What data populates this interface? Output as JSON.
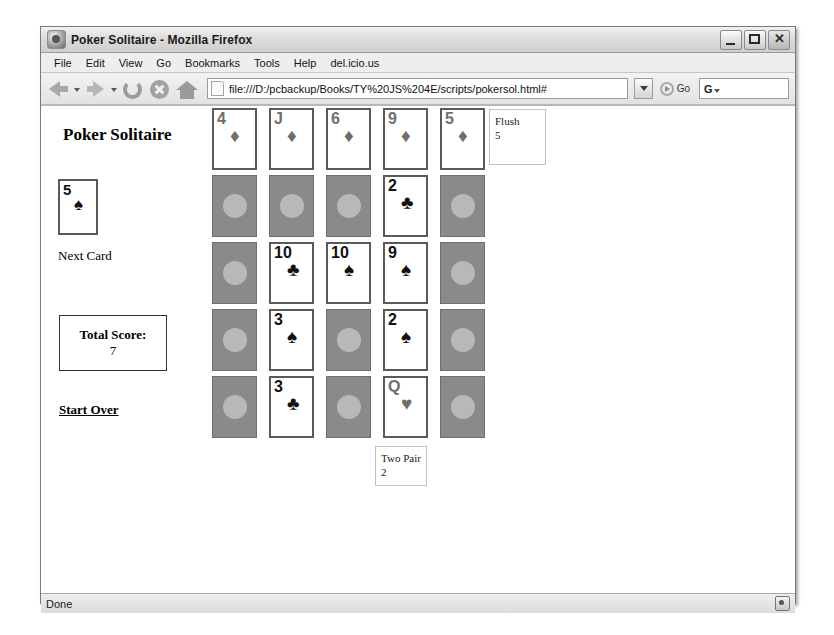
{
  "window": {
    "title": "Poker Solitaire - Mozilla Firefox",
    "app_icon": "firefox-icon",
    "minimize_label": "",
    "maximize_label": "",
    "close_label": "✕"
  },
  "menubar": {
    "items": [
      {
        "label": "File"
      },
      {
        "label": "Edit"
      },
      {
        "label": "View"
      },
      {
        "label": "Go"
      },
      {
        "label": "Bookmarks"
      },
      {
        "label": "Tools"
      },
      {
        "label": "Help"
      },
      {
        "label": "del.icio.us"
      }
    ]
  },
  "toolbar": {
    "back_icon": "back-arrow-icon",
    "forward_icon": "forward-arrow-icon",
    "reload_icon": "reload-icon",
    "stop_icon": "stop-icon",
    "home_icon": "home-icon",
    "url": "file:///D:/pcbackup/Books/TY%20JS%204E/scripts/pokersol.html#",
    "url_placeholder": "Enter address",
    "go_label": "Go",
    "search_value": "G",
    "search_placeholder": "Search"
  },
  "page": {
    "title": "Poker Solitaire",
    "next_card": {
      "rank": "5",
      "suit": "♠",
      "color": "black",
      "face_up": true
    },
    "next_card_label": "Next Card",
    "score_label": "Total Score:",
    "score_value": "7",
    "start_over_label": "Start Over",
    "grid": [
      [
        {
          "face_up": true,
          "rank": "4",
          "suit": "♦",
          "color": "red"
        },
        {
          "face_up": true,
          "rank": "J",
          "suit": "♦",
          "color": "red"
        },
        {
          "face_up": true,
          "rank": "6",
          "suit": "♦",
          "color": "red"
        },
        {
          "face_up": true,
          "rank": "9",
          "suit": "♦",
          "color": "red"
        },
        {
          "face_up": true,
          "rank": "5",
          "suit": "♦",
          "color": "red"
        }
      ],
      [
        {
          "face_up": false,
          "rank": "",
          "suit": "",
          "color": ""
        },
        {
          "face_up": false,
          "rank": "",
          "suit": "",
          "color": ""
        },
        {
          "face_up": false,
          "rank": "",
          "suit": "",
          "color": ""
        },
        {
          "face_up": true,
          "rank": "2",
          "suit": "♣",
          "color": "black"
        },
        {
          "face_up": false,
          "rank": "",
          "suit": "",
          "color": ""
        }
      ],
      [
        {
          "face_up": false,
          "rank": "",
          "suit": "",
          "color": ""
        },
        {
          "face_up": true,
          "rank": "10",
          "suit": "♣",
          "color": "black"
        },
        {
          "face_up": true,
          "rank": "10",
          "suit": "♠",
          "color": "black"
        },
        {
          "face_up": true,
          "rank": "9",
          "suit": "♠",
          "color": "black"
        },
        {
          "face_up": false,
          "rank": "",
          "suit": "",
          "color": ""
        }
      ],
      [
        {
          "face_up": false,
          "rank": "",
          "suit": "",
          "color": ""
        },
        {
          "face_up": true,
          "rank": "3",
          "suit": "♠",
          "color": "black"
        },
        {
          "face_up": false,
          "rank": "",
          "suit": "",
          "color": ""
        },
        {
          "face_up": true,
          "rank": "2",
          "suit": "♠",
          "color": "black"
        },
        {
          "face_up": false,
          "rank": "",
          "suit": "",
          "color": ""
        }
      ],
      [
        {
          "face_up": false,
          "rank": "",
          "suit": "",
          "color": ""
        },
        {
          "face_up": true,
          "rank": "3",
          "suit": "♣",
          "color": "black"
        },
        {
          "face_up": false,
          "rank": "",
          "suit": "",
          "color": ""
        },
        {
          "face_up": true,
          "rank": "Q",
          "suit": "♥",
          "color": "red"
        },
        {
          "face_up": false,
          "rank": "",
          "suit": "",
          "color": ""
        }
      ]
    ],
    "hand_scores": [
      {
        "name": "Flush",
        "points": "5"
      },
      {
        "name": "Two Pair",
        "points": "2"
      }
    ]
  },
  "statusbar": {
    "status_text": "Done",
    "security_icon": "lock-icon"
  }
}
